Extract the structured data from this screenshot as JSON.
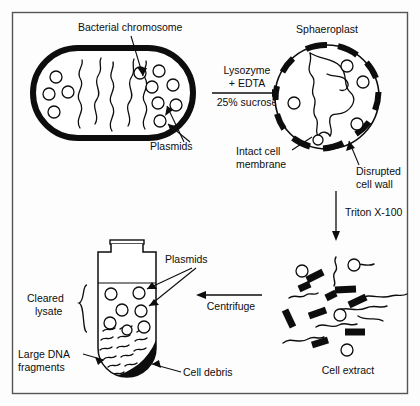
{
  "figure": {
    "type": "process-diagram",
    "frame_color": "#555555",
    "ink_color": "#0d0d0d",
    "background_color": "#fdfdfd"
  },
  "labels": {
    "bacterial_chromosome": "Bacterial chromosome",
    "plasmids_cell": "Plasmids",
    "sphaeroplast": "Sphaeroplast",
    "intact_cell_membrane_line1": "Intact cell",
    "intact_cell_membrane_line2": "membrane",
    "disrupted_cell_wall_line1": "Disrupted",
    "disrupted_cell_wall_line2": "cell wall",
    "cell_extract": "Cell extract",
    "plasmids_tube": "Plasmids",
    "cleared_lysate_line1": "Cleared",
    "cleared_lysate_line2": "lysate",
    "large_dna_fragments_line1": "Large DNA",
    "large_dna_fragments_line2": "fragments",
    "cell_debris": "Cell debris"
  },
  "steps": [
    {
      "id": "step-lysozyme",
      "reagent_line1": "Lysozyme",
      "reagent_line2": "+ EDTA",
      "condition": "25% sucrose",
      "direction": "right"
    },
    {
      "id": "step-triton",
      "reagent": "Triton X-100",
      "direction": "down"
    },
    {
      "id": "step-centrifuge",
      "reagent": "Centrifuge",
      "direction": "left"
    }
  ],
  "stages": [
    {
      "id": "bacterial-cell",
      "name": "Bacterial cell",
      "plasmid_count": 11
    },
    {
      "id": "sphaeroplast",
      "name": "Sphaeroplast",
      "plasmid_count": 5
    },
    {
      "id": "cell-extract",
      "name": "Cell extract",
      "plasmid_count": 4,
      "rod_count": 9
    },
    {
      "id": "centrifuge-tube",
      "name": "Centrifuge tube",
      "plasmid_count": 7
    }
  ]
}
